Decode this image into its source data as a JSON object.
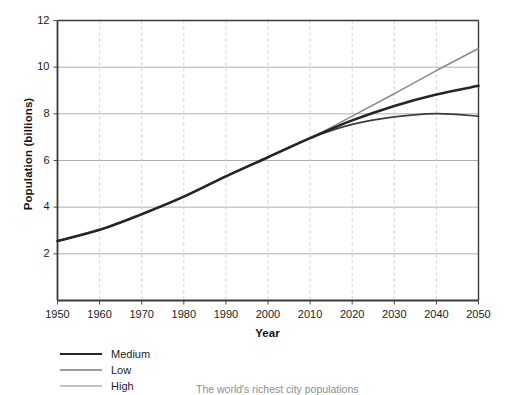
{
  "figure": {
    "caption": "The world's richest city populations"
  },
  "legend": {
    "items": [
      {
        "label": "Medium",
        "color": "#262626",
        "width": 2.6
      },
      {
        "label": "Low",
        "color": "#3d3d3d",
        "width": 1.7
      },
      {
        "label": "High",
        "color": "#8a8a8a",
        "width": 1.5
      }
    ]
  },
  "chart_data": {
    "type": "line",
    "title": "",
    "xlabel": "Year",
    "ylabel": "Population (billions)",
    "xlim": [
      1950,
      2050
    ],
    "ylim": [
      0,
      12
    ],
    "xticks": [
      1950,
      1960,
      1970,
      1980,
      1990,
      2000,
      2010,
      2020,
      2030,
      2040,
      2050
    ],
    "yticks": [
      2,
      4,
      6,
      8,
      10,
      12
    ],
    "grid": "horizontal solid light-gray, vertical dashed light-gray",
    "legend_position": "below-plot-left",
    "x": [
      1950,
      1960,
      1970,
      1980,
      1990,
      2000,
      2010,
      2020,
      2030,
      2040,
      2050
    ],
    "series": [
      {
        "name": "Medium",
        "color": "#262626",
        "values": [
          2.55,
          3.03,
          3.7,
          4.45,
          5.32,
          6.14,
          6.96,
          7.72,
          8.34,
          8.83,
          9.2
        ]
      },
      {
        "name": "Low",
        "color": "#3d3d3d",
        "values": [
          2.55,
          3.03,
          3.7,
          4.45,
          5.32,
          6.14,
          6.96,
          7.55,
          7.87,
          8.01,
          7.9
        ]
      },
      {
        "name": "High",
        "color": "#8a8a8a",
        "values": [
          2.55,
          3.03,
          3.7,
          4.45,
          5.32,
          6.14,
          6.96,
          7.9,
          8.86,
          9.85,
          10.8
        ]
      }
    ],
    "yticklabels": [
      "2",
      "4",
      "6",
      "8",
      "10",
      "12"
    ],
    "xticklabels": [
      "1950",
      "1960",
      "1970",
      "1980",
      "1990",
      "2000",
      "2010",
      "2020",
      "2030",
      "2040",
      "2050"
    ]
  }
}
